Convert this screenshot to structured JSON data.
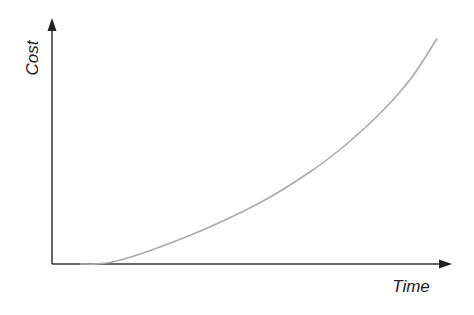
{
  "chart_data": {
    "type": "line",
    "title": "",
    "xlabel": "Time",
    "ylabel": "Cost",
    "x_ticks": [],
    "y_ticks": [],
    "grid": false,
    "legend": null,
    "series": [
      {
        "name": "Cost",
        "color": "#aaaaaa",
        "points_normalized": [
          {
            "x": 0.0,
            "y": 0.0
          },
          {
            "x": 0.1,
            "y": 0.01
          },
          {
            "x": 0.3,
            "y": 0.1
          },
          {
            "x": 0.5,
            "y": 0.22
          },
          {
            "x": 0.65,
            "y": 0.34
          },
          {
            "x": 0.75,
            "y": 0.44
          },
          {
            "x": 0.85,
            "y": 0.56
          },
          {
            "x": 0.93,
            "y": 0.68
          },
          {
            "x": 1.0,
            "y": 0.82
          }
        ]
      }
    ]
  },
  "colors": {
    "axis": "#333333",
    "curve": "#aaaaaa",
    "text": "#222222"
  }
}
